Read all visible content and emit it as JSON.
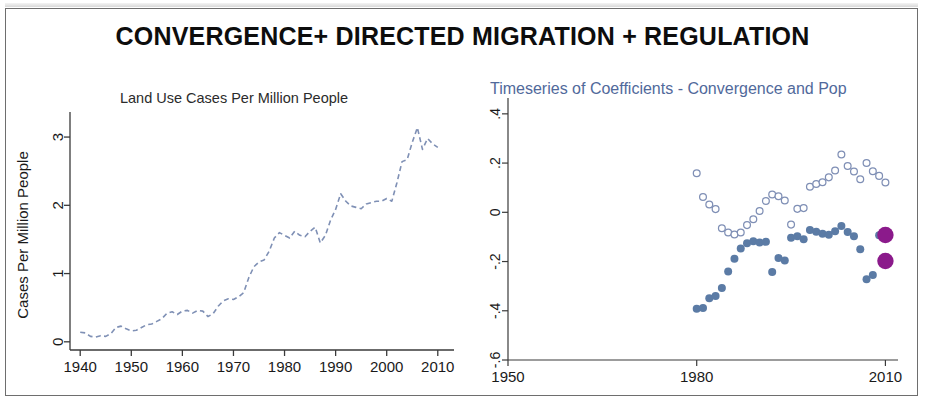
{
  "slide": {
    "title": "CONVERGENCE+ DIRECTED MIGRATION + REGULATION",
    "background_color": "#ffffff",
    "frame_color": "#6e6e6e"
  },
  "colors": {
    "line_series": "#7f90b5",
    "filled_marker": "#5b7ba5",
    "hollow_marker": "#7f8fb5",
    "highlight_marker": "#8b1a8b",
    "axis": "#3a3a3a",
    "right_title": "#51699b"
  },
  "chart_data": [
    {
      "id": "land-use-cases",
      "type": "line",
      "title": "Land Use Cases Per Million People",
      "xlabel": "",
      "ylabel": "Cases Per Million People",
      "xlim": [
        1938,
        2012
      ],
      "ylim": [
        -0.12,
        3.25
      ],
      "xticks": [
        1940,
        1950,
        1960,
        1970,
        1980,
        1990,
        2000,
        2010
      ],
      "yticks": [
        0,
        1,
        2,
        3
      ],
      "grid": false,
      "legend": "none",
      "line_style": "dashed",
      "x": [
        1940,
        1941,
        1942,
        1943,
        1944,
        1945,
        1946,
        1947,
        1948,
        1949,
        1950,
        1951,
        1952,
        1953,
        1954,
        1955,
        1956,
        1957,
        1958,
        1959,
        1960,
        1961,
        1962,
        1963,
        1964,
        1965,
        1966,
        1967,
        1968,
        1969,
        1970,
        1971,
        1972,
        1973,
        1974,
        1975,
        1976,
        1977,
        1978,
        1979,
        1980,
        1981,
        1982,
        1983,
        1984,
        1985,
        1986,
        1987,
        1988,
        1989,
        1990,
        1991,
        1992,
        1993,
        1994,
        1995,
        1996,
        1997,
        1998,
        1999,
        2000,
        2001,
        2002,
        2003,
        2004,
        2005,
        2006,
        2007,
        2008,
        2009,
        2010
      ],
      "y": [
        0.14,
        0.13,
        0.08,
        0.07,
        0.09,
        0.08,
        0.12,
        0.21,
        0.23,
        0.19,
        0.16,
        0.17,
        0.21,
        0.25,
        0.26,
        0.3,
        0.34,
        0.42,
        0.44,
        0.4,
        0.45,
        0.46,
        0.42,
        0.46,
        0.45,
        0.37,
        0.41,
        0.52,
        0.6,
        0.63,
        0.62,
        0.66,
        0.72,
        0.94,
        1.1,
        1.17,
        1.2,
        1.33,
        1.52,
        1.6,
        1.56,
        1.52,
        1.62,
        1.56,
        1.54,
        1.62,
        1.68,
        1.45,
        1.56,
        1.78,
        1.94,
        2.17,
        2.06,
        1.99,
        1.97,
        1.95,
        2.02,
        2.04,
        2.06,
        2.06,
        2.1,
        2.06,
        2.33,
        2.64,
        2.67,
        2.92,
        3.14,
        2.82,
        2.98,
        2.9,
        2.85
      ]
    },
    {
      "id": "coefficients-timeseries",
      "type": "scatter",
      "title": "Timeseries of Coefficients - Convergence and Pop",
      "xlabel": "",
      "ylabel": "",
      "xlim": [
        1950,
        2012
      ],
      "ylim": [
        -0.6,
        0.44
      ],
      "xticks": [
        1950,
        1980,
        2010
      ],
      "yticks": [
        0.4,
        0.2,
        0,
        -0.2,
        -0.4,
        -0.6
      ],
      "ytick_labels": [
        ".4",
        ".2",
        "0",
        "-.2",
        "-.4",
        "-.6"
      ],
      "grid": false,
      "legend": "none",
      "series": [
        {
          "name": "Population coefficient (hollow)",
          "marker": "open-circle",
          "color": "#7f8fb5",
          "x": [
            1980,
            1981,
            1982,
            1983,
            1984,
            1985,
            1986,
            1987,
            1988,
            1989,
            1990,
            1991,
            1992,
            1993,
            1994,
            1995,
            1996,
            1997,
            1998,
            1999,
            2000,
            2001,
            2002,
            2003,
            2004,
            2005,
            2006,
            2007,
            2008,
            2009,
            2010
          ],
          "y": [
            0.159,
            0.062,
            0.032,
            0.013,
            -0.065,
            -0.082,
            -0.09,
            -0.082,
            -0.052,
            -0.028,
            0.005,
            0.046,
            0.072,
            0.065,
            0.048,
            -0.05,
            0.014,
            0.017,
            0.104,
            0.115,
            0.122,
            0.142,
            0.17,
            0.235,
            0.188,
            0.166,
            0.134,
            0.2,
            0.167,
            0.148,
            0.121
          ]
        },
        {
          "name": "Convergence coefficient (filled)",
          "marker": "filled-circle",
          "color": "#5b7ba5",
          "x": [
            1980,
            1981,
            1982,
            1983,
            1984,
            1985,
            1986,
            1987,
            1988,
            1989,
            1990,
            1991,
            1992,
            1993,
            1994,
            1995,
            1996,
            1997,
            1998,
            1999,
            2000,
            2001,
            2002,
            2003,
            2004,
            2005,
            2006,
            2007,
            2008,
            2009,
            2010
          ],
          "y": [
            -0.392,
            -0.389,
            -0.349,
            -0.34,
            -0.308,
            -0.24,
            -0.189,
            -0.147,
            -0.126,
            -0.118,
            -0.123,
            -0.12,
            -0.243,
            -0.186,
            -0.196,
            -0.103,
            -0.097,
            -0.109,
            -0.072,
            -0.079,
            -0.087,
            -0.091,
            -0.077,
            -0.056,
            -0.08,
            -0.097,
            -0.15,
            -0.272,
            -0.255,
            -0.093,
            -0.198
          ]
        },
        {
          "name": "Final period highlight",
          "marker": "filled-circle-large",
          "color": "#8b1a8b",
          "x": [
            2010,
            2010
          ],
          "y": [
            -0.092,
            -0.198
          ]
        }
      ]
    }
  ]
}
